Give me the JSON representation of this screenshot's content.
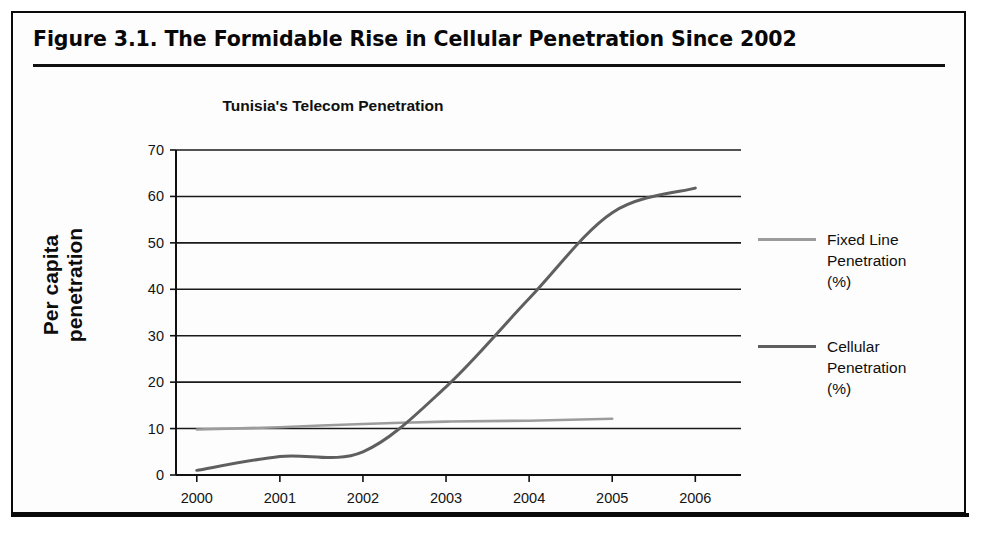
{
  "figure": {
    "caption": "Figure 3.1.  The Formidable Rise in Cellular Penetration Since 2002"
  },
  "chart_data": {
    "type": "line",
    "title": "Tunisia's Telecom Penetration",
    "xlabel": "",
    "ylabel": "Per capita penetration",
    "x": [
      2000,
      2001,
      2002,
      2003,
      2004,
      2005,
      2006
    ],
    "xtick_labels": [
      "2000",
      "2001",
      "2002",
      "2003",
      "2004",
      "2005",
      "2006"
    ],
    "ytick_labels": [
      "0",
      "10",
      "20",
      "30",
      "40",
      "50",
      "60",
      "70"
    ],
    "ylim": [
      0,
      70
    ],
    "ytick_step": 10,
    "xlim": [
      1999.75,
      2006.55
    ],
    "grid": "horizontal",
    "legend_position": "right",
    "series": [
      {
        "name": "Fixed Line\nPenetration\n(%)",
        "legend_label": "Fixed Line Penetration (%)",
        "color": "#9c9c9c",
        "x": [
          2000,
          2001,
          2002,
          2003,
          2004,
          2005
        ],
        "values": [
          9.8,
          10.3,
          11.0,
          11.5,
          11.7,
          12.1
        ]
      },
      {
        "name": "Cellular\nPenetration\n(%)",
        "legend_label": "Cellular Penetration (%)",
        "color": "#5f5f5f",
        "x": [
          2000,
          2001,
          2002,
          2003,
          2004,
          2005,
          2006
        ],
        "values": [
          1.0,
          4.0,
          5.0,
          19.0,
          38.0,
          56.5,
          61.8
        ]
      }
    ],
    "annotations": []
  },
  "legend": {
    "entries": [
      {
        "label": "Fixed Line\nPenetration\n(%)",
        "color": "#9c9c9c"
      },
      {
        "label": "Cellular\nPenetration\n(%)",
        "color": "#5f5f5f"
      }
    ]
  }
}
